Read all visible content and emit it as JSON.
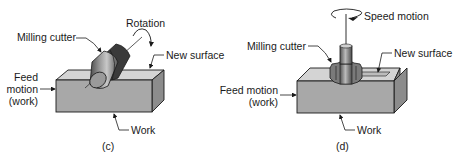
{
  "figure": {
    "panels": [
      {
        "id": "c",
        "caption": "(c)",
        "title": "Peripheral (horizontal) milling",
        "labels": {
          "milling_cutter": "Milling cutter",
          "rotation": "Rotation",
          "new_surface": "New surface",
          "feed_line1": "Feed",
          "feed_line2": "motion",
          "feed_line3": "(work)",
          "work": "Work"
        }
      },
      {
        "id": "d",
        "caption": "(d)",
        "labels": {
          "speed_motion": "Speed motion",
          "milling_cutter": "Milling cutter",
          "new_surface": "New surface",
          "feed_line1": "Feed motion",
          "feed_line2": "(work)",
          "work": "Work"
        }
      }
    ],
    "colors": {
      "front_face": "#a8a8a8",
      "top_face": "#d4d4d4",
      "side_face": "#8c8c8c",
      "outline": "#1a1a1a",
      "cutter_dark": "#3a3a3a",
      "cutter_mid": "#7a7a7a",
      "cutter_light": "#bdbdbd"
    }
  }
}
